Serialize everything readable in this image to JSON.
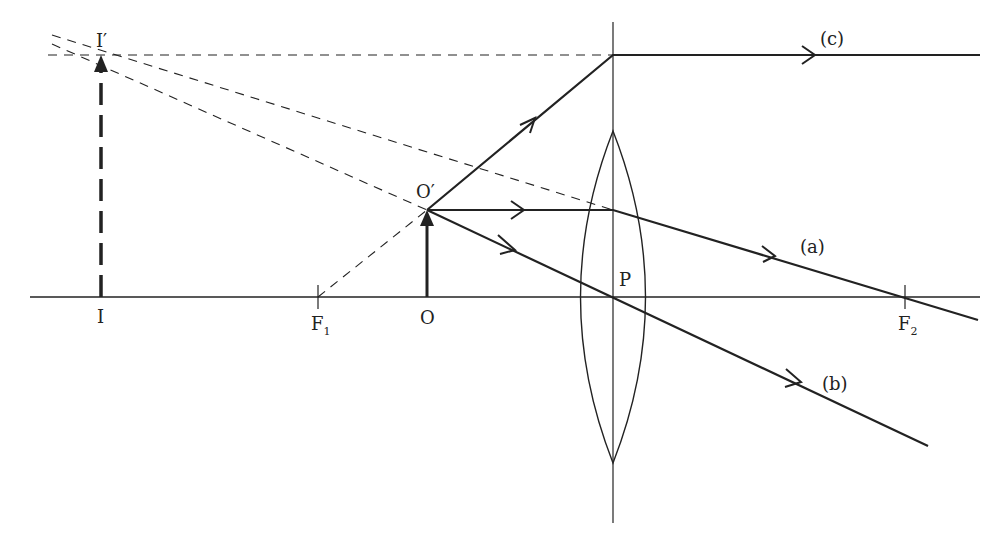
{
  "diagram": {
    "labels": {
      "image_top": "I′",
      "image_base": "I",
      "focus1": "F",
      "focus1_sub": "1",
      "object_base": "O",
      "object_top": "O′",
      "lens_center": "P",
      "focus2": "F",
      "focus2_sub": "2",
      "ray_a": "(a)",
      "ray_b": "(b)",
      "ray_c": "(c)"
    },
    "colors": {
      "line": "#222222",
      "background": "#ffffff"
    }
  }
}
